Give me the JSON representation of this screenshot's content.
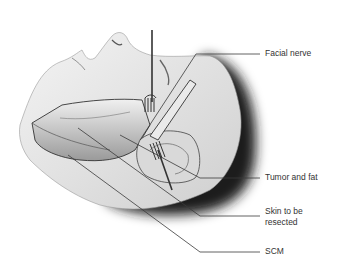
{
  "figure": {
    "colors": {
      "line": "#3a3a3a",
      "hair": "#1e1e1e",
      "skin": "#e6e6e6",
      "background": "#ffffff"
    }
  },
  "labels": [
    {
      "id": "facial-nerve",
      "text": "Facial nerve"
    },
    {
      "id": "tumor-and-fat",
      "text": "Tumor and fat"
    },
    {
      "id": "skin-resected-1",
      "text": "Skin to be"
    },
    {
      "id": "skin-resected-2",
      "text": "resected"
    },
    {
      "id": "scm",
      "text": "SCM"
    }
  ]
}
